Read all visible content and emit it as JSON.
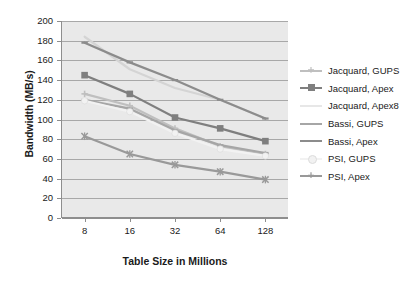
{
  "chart_data": {
    "type": "line",
    "title": "",
    "xlabel": "Table Size in Millions",
    "ylabel": "Bandwidth (MB/s)",
    "categories": [
      "8",
      "16",
      "32",
      "64",
      "128"
    ],
    "ylim": [
      0,
      200
    ],
    "ytick_step": 20,
    "yticks": [
      "200",
      "180",
      "160",
      "140",
      "120",
      "100",
      "80",
      "60",
      "40",
      "20",
      "0"
    ],
    "grid": true,
    "legend_position": "right",
    "series": [
      {
        "name": "Jacquard, GUPS",
        "values": [
          126,
          114,
          91,
          73,
          65
        ],
        "color": "#bfbfbf",
        "marker": "plus"
      },
      {
        "name": "Jacquard, Apex",
        "values": [
          145,
          126,
          102,
          91,
          78
        ],
        "color": "#7f7f7f",
        "marker": "square"
      },
      {
        "name": "Jacquard, Apex8",
        "values": [
          184,
          151,
          132,
          120,
          101
        ],
        "color": "#d4d4d4",
        "marker": "none"
      },
      {
        "name": "Bassi, GUPS",
        "values": [
          120,
          111,
          89,
          74,
          66
        ],
        "color": "#a6a6a6",
        "marker": "dash"
      },
      {
        "name": "Bassi, Apex",
        "values": [
          178,
          158,
          140,
          120,
          101
        ],
        "color": "#8c8c8c",
        "marker": "dash"
      },
      {
        "name": "PSI, GUPS",
        "values": [
          119,
          108,
          86,
          70,
          63
        ],
        "color": "#f2f2f2",
        "marker": "circle"
      },
      {
        "name": "PSI, Apex",
        "values": [
          83,
          65,
          54,
          47,
          39
        ],
        "color": "#999999",
        "marker": "cross"
      }
    ]
  },
  "legend": {
    "items": [
      {
        "label": "Jacquard, GUPS"
      },
      {
        "label": "Jacquard, Apex"
      },
      {
        "label": "Jacquard, Apex8"
      },
      {
        "label": "Bassi, GUPS"
      },
      {
        "label": "Bassi, Apex"
      },
      {
        "label": "PSI, GUPS"
      },
      {
        "label": "PSI, Apex"
      }
    ]
  }
}
